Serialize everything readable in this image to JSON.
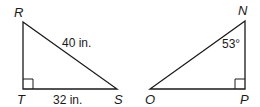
{
  "triangles": [
    {
      "name": "RTS",
      "vertices": {
        "top": "R",
        "right_angle": "T",
        "acute": "S"
      },
      "hypotenuse_label": "40 in.",
      "base_label": "32 in.",
      "right_angle_at": "T"
    },
    {
      "name": "NPO",
      "vertices": {
        "top": "N",
        "right_angle": "P",
        "acute": "O"
      },
      "angle_label": "53°",
      "angle_at": "N",
      "right_angle_at": "P"
    }
  ],
  "colors": {
    "stroke": "#1a1a1a",
    "background": "#ffffff"
  }
}
